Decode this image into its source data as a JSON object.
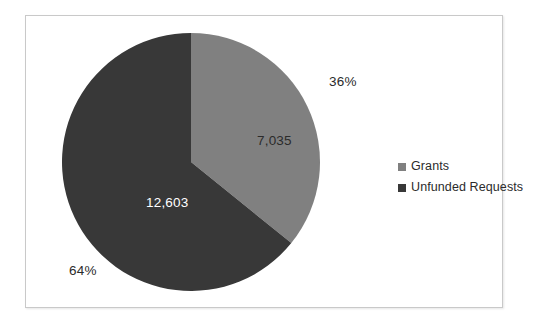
{
  "chart_data": {
    "type": "pie",
    "title": "",
    "categories": [
      "Grants",
      "Unfunded Requests"
    ],
    "values": [
      7035,
      12603
    ],
    "value_labels": [
      "7,035",
      "12,603"
    ],
    "percent_labels": [
      "36%",
      "64%"
    ],
    "percents": [
      36,
      64
    ],
    "total": 19638,
    "colors": [
      "#808080",
      "#383838"
    ],
    "start_angle_deg": 0,
    "direction": "clockwise",
    "legend_position": "right",
    "grid": false,
    "series": [
      {
        "name": "Grants",
        "value": 7035,
        "value_label": "7,035",
        "percent_label": "36%",
        "color": "#808080"
      },
      {
        "name": "Unfunded Requests",
        "value": 12603,
        "value_label": "12,603",
        "percent_label": "64%",
        "color": "#383838"
      }
    ]
  },
  "legend": {
    "items": [
      {
        "label": "Grants",
        "color": "#808080"
      },
      {
        "label": "Unfunded Requests",
        "color": "#383838"
      }
    ]
  },
  "frame": {
    "border_color": "#c9c9c9",
    "background": "#ffffff"
  }
}
